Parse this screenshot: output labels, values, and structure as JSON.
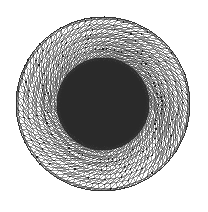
{
  "figure": {
    "title": "",
    "caption": "",
    "background_color": "#ffffff",
    "canvas": {
      "width": 208,
      "height": 212
    }
  },
  "chart_data": {
    "type": "diagram",
    "subtype": "finite-element-triangular-mesh",
    "title": "",
    "xlabel": "",
    "ylabel": "",
    "grid": false,
    "legend": null,
    "annotations": [],
    "geometry": {
      "shape": "disk",
      "center": {
        "x": 103,
        "y": 104
      },
      "outer_radius": 87,
      "inner_radius": 46,
      "regions": [
        {
          "name": "outer-annulus",
          "description": "coarse graded triangular mesh",
          "inner_radius": 46,
          "outer_radius": 87,
          "mesh_density": "coarse",
          "edge_color": "#3d3d3d",
          "node_color": "#1a1a1a",
          "fill_color": "#ffffff",
          "ring_count": 13,
          "angular_divisions_outer": 56,
          "angular_divisions_inner": 40
        },
        {
          "name": "inner-disk",
          "description": "very fine unstructured triangular mesh",
          "inner_radius": 0,
          "outer_radius": 46,
          "mesh_density": "fine",
          "edge_color": "#2a2a2a",
          "fill_color": "#3a3a3a",
          "ring_count": 46,
          "angular_divisions_outer": 190
        }
      ]
    },
    "colors": {
      "background": "#ffffff",
      "outer_mesh_line": "#3d3d3d",
      "outer_mesh_node": "#1a1a1a",
      "inner_mesh_line": "#2a2a2a",
      "inner_mesh_fill": "#3a3a3a",
      "boundary": "#2b2b2b"
    }
  }
}
